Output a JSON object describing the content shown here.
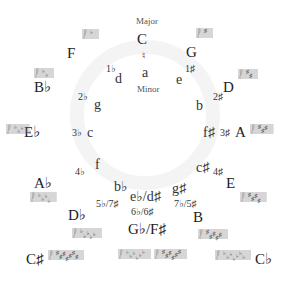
{
  "diagram": {
    "title_major": "Major",
    "title_minor": "Minor",
    "center_sig": "♮",
    "majors": [
      {
        "key": "C",
        "x": 137,
        "y": 32
      },
      {
        "key": "G",
        "x": 186,
        "y": 45
      },
      {
        "key": "D",
        "x": 223,
        "y": 80
      },
      {
        "key": "A",
        "x": 235,
        "y": 125
      },
      {
        "key": "E",
        "x": 226,
        "y": 176
      },
      {
        "key": "B",
        "x": 193,
        "y": 210
      },
      {
        "key": "G♭/F♯",
        "x": 128,
        "y": 222
      },
      {
        "key": "D♭",
        "x": 68,
        "y": 208
      },
      {
        "key": "A♭",
        "x": 34,
        "y": 176
      },
      {
        "key": "E♭",
        "x": 24,
        "y": 125
      },
      {
        "key": "B♭",
        "x": 34,
        "y": 80
      },
      {
        "key": "F",
        "x": 67,
        "y": 46
      },
      {
        "key": "C♯",
        "x": 26,
        "y": 252
      },
      {
        "key": "C♭",
        "x": 255,
        "y": 252
      }
    ],
    "minors": [
      {
        "key": "a",
        "x": 142,
        "y": 66
      },
      {
        "key": "e",
        "x": 176,
        "y": 73
      },
      {
        "key": "b",
        "x": 196,
        "y": 99
      },
      {
        "key": "f♯",
        "x": 203,
        "y": 126
      },
      {
        "key": "c♯",
        "x": 196,
        "y": 161
      },
      {
        "key": "g♯",
        "x": 172,
        "y": 182
      },
      {
        "key": "e♭/d♯",
        "x": 130,
        "y": 190
      },
      {
        "key": "b♭",
        "x": 114,
        "y": 180
      },
      {
        "key": "f",
        "x": 95,
        "y": 158
      },
      {
        "key": "c",
        "x": 87,
        "y": 126
      },
      {
        "key": "g",
        "x": 94,
        "y": 98
      },
      {
        "key": "d",
        "x": 115,
        "y": 72
      }
    ],
    "signatures": [
      {
        "sig": "1♯",
        "x": 185,
        "y": 64
      },
      {
        "sig": "2♯",
        "x": 213,
        "y": 92
      },
      {
        "sig": "3♯",
        "x": 220,
        "y": 128
      },
      {
        "sig": "4♯",
        "x": 213,
        "y": 167
      },
      {
        "sig": "7♭/5♯",
        "x": 174,
        "y": 199
      },
      {
        "sig": "6♭/6♯",
        "x": 131,
        "y": 207
      },
      {
        "sig": "5♭/7♯",
        "x": 96,
        "y": 199
      },
      {
        "sig": "4♭",
        "x": 75,
        "y": 167
      },
      {
        "sig": "3♭",
        "x": 72,
        "y": 128
      },
      {
        "sig": "2♭",
        "x": 78,
        "y": 92
      },
      {
        "sig": "1♭",
        "x": 106,
        "y": 64
      }
    ],
    "staves": [
      {
        "name": "G",
        "x": 196,
        "y": 26,
        "acc": 1,
        "type": "sharp"
      },
      {
        "name": "D",
        "x": 238,
        "y": 67,
        "acc": 2,
        "type": "sharp"
      },
      {
        "name": "A",
        "x": 250,
        "y": 122,
        "acc": 3,
        "type": "sharp"
      },
      {
        "name": "E",
        "x": 240,
        "y": 190,
        "acc": 4,
        "type": "sharp"
      },
      {
        "name": "B",
        "x": 198,
        "y": 227,
        "acc": 5,
        "type": "sharp"
      },
      {
        "name": "F♯",
        "x": 154,
        "y": 247,
        "acc": 6,
        "type": "sharp"
      },
      {
        "name": "C♭",
        "x": 215,
        "y": 248,
        "acc": 7,
        "type": "flat"
      },
      {
        "name": "G♭",
        "x": 118,
        "y": 247,
        "acc": 6,
        "type": "flat"
      },
      {
        "name": "C♯",
        "x": 48,
        "y": 248,
        "acc": 7,
        "type": "sharp"
      },
      {
        "name": "D♭",
        "x": 72,
        "y": 226,
        "acc": 5,
        "type": "flat"
      },
      {
        "name": "A♭",
        "x": 30,
        "y": 190,
        "acc": 4,
        "type": "flat"
      },
      {
        "name": "E♭",
        "x": 6,
        "y": 122,
        "acc": 3,
        "type": "flat"
      },
      {
        "name": "B♭",
        "x": 34,
        "y": 66,
        "acc": 2,
        "type": "flat"
      },
      {
        "name": "F",
        "x": 82,
        "y": 27,
        "acc": 1,
        "type": "flat"
      }
    ],
    "colors": {
      "text": "#222222",
      "ring": "#f4f4f4",
      "staff": "#777777"
    }
  }
}
